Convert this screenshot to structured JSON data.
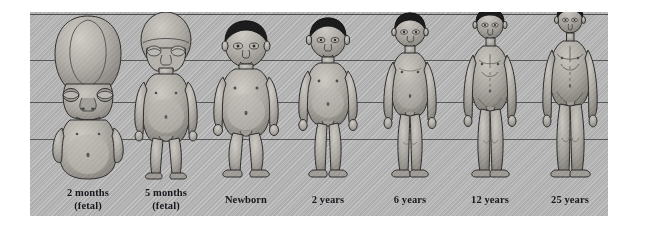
{
  "diagram": {
    "panel": {
      "background_color": "#b5b5b5",
      "left": 30,
      "top": 12,
      "width": 578,
      "height": 204
    },
    "reference_lines": {
      "color": "#3a3a3a",
      "count": 4,
      "y_positions": [
        2,
        48,
        90,
        127
      ],
      "description": "horizontal proportion reference lines marking head top, chin/shoulder, umbilicus/pelvis and knee levels"
    },
    "stages": [
      {
        "id": "fetal-2-months",
        "label_line1": "2 months",
        "label_line2": "(fetal)",
        "hair": "none",
        "head_fraction": 0.5,
        "relative_height": 0.73,
        "x": 18
      },
      {
        "id": "fetal-5-months",
        "label_line1": "5 months",
        "label_line2": "(fetal)",
        "hair": "none",
        "head_fraction": 0.33,
        "relative_height": 0.8,
        "x": 96
      },
      {
        "id": "newborn",
        "label_line1": "Newborn",
        "label_line2": "",
        "hair": "dark",
        "head_fraction": 0.25,
        "relative_height": 0.86,
        "x": 176
      },
      {
        "id": "age-2-years",
        "label_line1": "2 years",
        "label_line2": "",
        "hair": "dark",
        "head_fraction": 0.2,
        "relative_height": 0.9,
        "x": 258
      },
      {
        "id": "age-6-years",
        "label_line1": "6 years",
        "label_line2": "",
        "hair": "dark",
        "head_fraction": 0.167,
        "relative_height": 0.94,
        "x": 340
      },
      {
        "id": "age-12-years",
        "label_line1": "12  years",
        "label_line2": "",
        "hair": "dark",
        "head_fraction": 0.143,
        "relative_height": 0.97,
        "x": 420
      },
      {
        "id": "age-25-years",
        "label_line1": "25  years",
        "label_line2": "",
        "hair": "dark",
        "head_fraction": 0.125,
        "relative_height": 1.0,
        "x": 500
      }
    ],
    "colors": {
      "skin_light": "#c9c5bf",
      "skin_mid": "#a6a29c",
      "skin_shadow": "#7d7a75",
      "outline": "#2d2d2d",
      "hair": "#1b1b1b",
      "caption_text": "#15171c"
    }
  }
}
